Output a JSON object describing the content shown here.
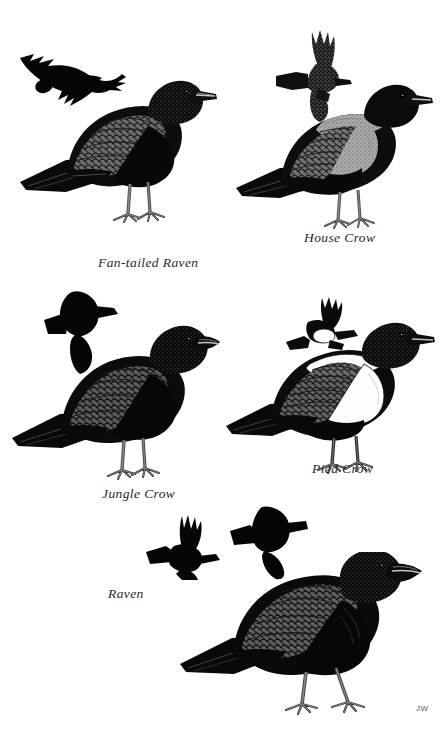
{
  "plate": {
    "title": "Crows and Ravens",
    "background_color": "#ffffff",
    "ink_color": "#000000",
    "width": 445,
    "height": 731,
    "artist_signature": "JW"
  },
  "species": [
    {
      "id": "fan-tailed-raven",
      "label": "Fan-tailed Raven",
      "plumage": "all black, glossed; short fan-shaped tail; heavy bill",
      "figures": [
        "flight-silhouette",
        "perched"
      ],
      "caption_position": "below-left"
    },
    {
      "id": "house-crow",
      "label": "House Crow",
      "plumage": "black with grey nape, neck and breast; black face, wings and tail",
      "figures": [
        "flight-above",
        "perched"
      ],
      "caption_position": "below-right"
    },
    {
      "id": "jungle-crow",
      "label": "Jungle Crow",
      "plumage": "entirely glossy black; very heavy arched bill; long wedge tail",
      "figures": [
        "flight-silhouette",
        "perched"
      ],
      "caption_position": "below-left"
    },
    {
      "id": "pied-crow",
      "label": "Pied Crow",
      "plumage": "black with broad white breast and white collar across nape",
      "figures": [
        "flight-above",
        "perched"
      ],
      "caption_position": "below-right"
    },
    {
      "id": "raven",
      "label": "Raven",
      "plumage": "all black; shaggy throat hackles; wedge-shaped tail; massive bill",
      "figures": [
        "flight-underside",
        "flight-upperside",
        "perched"
      ],
      "caption_position": "below-left"
    }
  ],
  "captions": {
    "fan_tailed_raven": "Fan-tailed Raven",
    "house_crow": "House Crow",
    "jungle_crow": "Jungle Crow",
    "pied_crow": "Pied Crow",
    "raven": "Raven"
  },
  "signature": {
    "initials": "JW"
  }
}
